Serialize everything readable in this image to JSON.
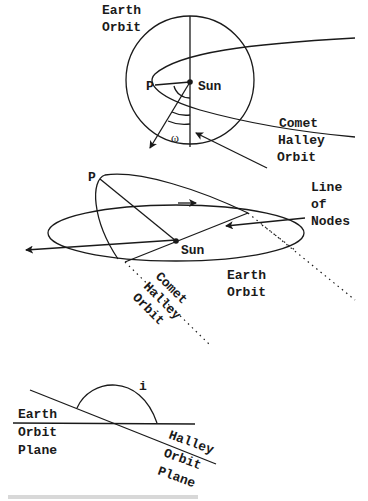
{
  "diagram": {
    "top_view": {
      "labels": {
        "earth_orbit_1": "Earth",
        "earth_orbit_2": "Orbit",
        "sun": "Sun",
        "perihelion": "P",
        "omega": "ω",
        "comet_1": "Comet",
        "comet_2": "Halley",
        "comet_3": "Orbit",
        "nodes_1": "Line",
        "nodes_2": "of",
        "nodes_3": "Nodes"
      }
    },
    "perspective_view": {
      "labels": {
        "perihelion": "P",
        "sun": "Sun",
        "earth_orbit_1": "Earth",
        "earth_orbit_2": "Orbit",
        "comet_1": "Comet",
        "comet_2": "Halley",
        "comet_3": "Orbit"
      }
    },
    "inclination_view": {
      "labels": {
        "inclination": "i",
        "earth_plane_1": "Earth",
        "earth_plane_2": "Orbit",
        "earth_plane_3": "Plane",
        "halley_plane_1": "Halley",
        "halley_plane_2": "Orbit",
        "halley_plane_3": "Plane"
      }
    }
  }
}
